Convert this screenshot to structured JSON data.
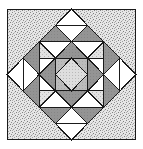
{
  "image": {
    "kind": "quilt-block-diagram",
    "title": "Patchwork Quilt Block",
    "width": 143,
    "height": 149,
    "background": "#ffffff",
    "outline_color": "#1a1a1a",
    "outline_width": 1
  },
  "frame": {
    "x": 7,
    "y": 9,
    "width": 129,
    "height": 131,
    "border_color": "#1a1a1a",
    "label": "block-border"
  },
  "grid": {
    "columns": 8,
    "rows": 8,
    "cell_size": 16.125,
    "origin_x": 7,
    "origin_y": 9,
    "layout": "on-point medallion with corner triangles"
  },
  "fabrics": [
    {
      "key": "white",
      "name": "white-solid",
      "color": "#ffffff",
      "texture": "none"
    },
    {
      "key": "light",
      "name": "light-gray-stipple",
      "color": "#dcdcdc",
      "texture": "fine-dots"
    },
    {
      "key": "medium",
      "name": "medium-gray-solid",
      "color": "#b8b8b8",
      "texture": "none"
    },
    {
      "key": "dark",
      "name": "dark-gray-solid",
      "color": "#8f8f8f",
      "texture": "none"
    },
    {
      "key": "speckle",
      "name": "gray-speckle-print",
      "color": "#c9c9c9",
      "texture": "coarse-speckle"
    },
    {
      "key": "center",
      "name": "pale-dot-print",
      "color": "#d8d8d8",
      "texture": "pin-dots"
    }
  ],
  "legend": {
    "visible": false,
    "entries": [
      {
        "label": "White",
        "fabric": "white"
      },
      {
        "label": "Light gray stipple",
        "fabric": "light"
      },
      {
        "label": "Medium gray",
        "fabric": "medium"
      },
      {
        "label": "Dark gray",
        "fabric": "dark"
      },
      {
        "label": "Gray speckle",
        "fabric": "speckle"
      }
    ]
  },
  "regions": {
    "corners": {
      "name": "corner-speckle-triangles",
      "fabric": "speckle",
      "count": 4,
      "description": "Four large speckled right triangles filling the corners outside the on-point square"
    },
    "center_square": {
      "name": "center-on-point-square",
      "fabric": "center",
      "description": "Central square set on point, pale dotted print"
    },
    "star_points": {
      "name": "dark-star-points",
      "fabric": "dark",
      "count": 8,
      "description": "Dark gray triangles radiating from the center square"
    },
    "corner_blocks": {
      "name": "pieced-corner-units",
      "fabric": "light",
      "count": 4,
      "description": "Light gray squares containing a nested small square and diagonal divisions"
    },
    "white_diamonds": {
      "name": "white-diamond-accents",
      "fabric": "white",
      "count": 12,
      "description": "White on-point squares at the edge midpoints and around the medallion"
    }
  },
  "notes": {
    "symmetry": "4-fold rotational symmetry about the block center",
    "style": "line drawing with hatched fills, black outlines"
  }
}
